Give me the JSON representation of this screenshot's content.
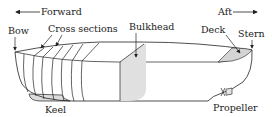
{
  "diagram": {
    "direction": {
      "forward": "Forward",
      "aft": "Aft"
    },
    "labels": {
      "bow": "Bow",
      "cross_sections": "Cross sections",
      "bulkhead": "Bulkhead",
      "deck": "Deck",
      "stern": "Stern",
      "keel": "Keel",
      "propeller": "Propeller"
    },
    "colors": {
      "ink": "#222222",
      "shade": "#d9d9d9",
      "background": "#ffffff"
    }
  }
}
